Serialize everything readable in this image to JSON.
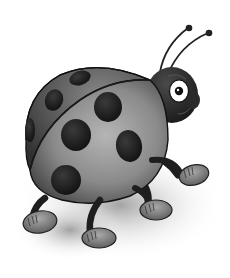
{
  "image": {
    "subject": "cartoon ladybug",
    "style": "grayscale illustration",
    "width": 230,
    "height": 278,
    "colors": {
      "background": "#ffffff",
      "shell_light": "#9a9a9a",
      "shell_dark": "#3a3a3a",
      "spots": "#1c1c1c",
      "body": "#2a2a2a",
      "shoes": "#8a8a8a",
      "eye_white": "#ffffff",
      "shadow": "#bfbfbf"
    },
    "parts": {
      "spots_count": 7,
      "legs_count": 4,
      "antennae_count": 2
    }
  }
}
